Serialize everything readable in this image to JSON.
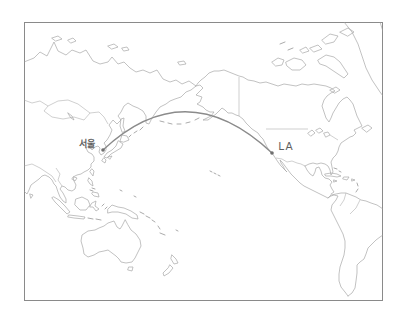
{
  "figure": {
    "background_color": "#ffffff",
    "frame_color": "#8a8a8a",
    "coastline_color": "#a8a8a8",
    "route": {
      "arc_color": "#8b8b8b",
      "marker_color": "#6f6f6f",
      "label_color": "#5f5f5f",
      "origin": {
        "label": "서울",
        "x": 103,
        "y": 150
      },
      "destination": {
        "label": "LA",
        "x": 272,
        "y": 153
      }
    }
  }
}
